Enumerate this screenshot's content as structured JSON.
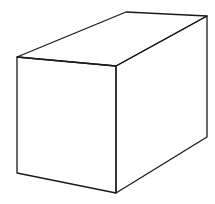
{
  "figure": {
    "stroke_color": "#1a1a1a",
    "stroke_width": 1.3,
    "background": "#ffffff",
    "vertices": {
      "front_top_left": [
        17,
        57
      ],
      "front_top_right": [
        116,
        66
      ],
      "front_bottom_right": [
        116,
        193
      ],
      "front_bottom_left": [
        17,
        173
      ],
      "back_top_left": [
        126,
        12
      ],
      "back_top_right": [
        207,
        16
      ],
      "back_bottom_right": [
        207,
        137
      ]
    },
    "faces": {
      "front": [
        "front_top_left",
        "front_top_right",
        "front_bottom_right",
        "front_bottom_left"
      ],
      "top": [
        "front_top_left",
        "back_top_left",
        "back_top_right",
        "front_top_right"
      ],
      "right": [
        "front_top_right",
        "back_top_right",
        "back_bottom_right",
        "front_bottom_right"
      ]
    }
  }
}
